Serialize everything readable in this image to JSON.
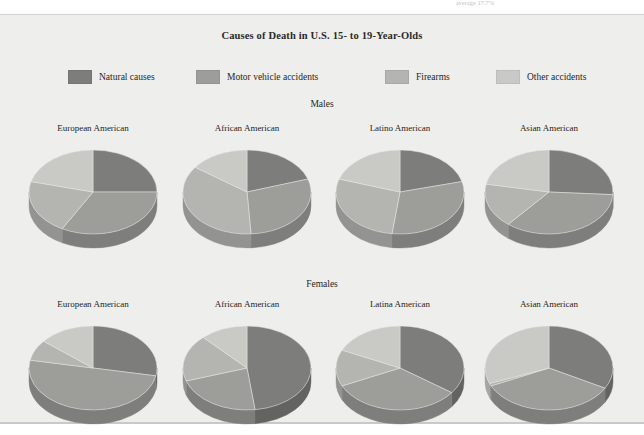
{
  "page": {
    "clipped_top_text": "average 17.7%",
    "background": "#eeeeec"
  },
  "figure": {
    "title": "Causes of Death in U.S. 15- to 19-Year-Olds",
    "sections": [
      {
        "id": "males",
        "heading": "Males"
      },
      {
        "id": "females",
        "heading": "Females"
      }
    ]
  },
  "legend": {
    "items": [
      {
        "label": "Natural causes",
        "color": "#7d7d7b",
        "key": "natural"
      },
      {
        "label": "Motor vehicle accidents",
        "color": "#9d9d9a",
        "key": "motor"
      },
      {
        "label": "Firearms",
        "color": "#b4b4b1",
        "key": "firearms"
      },
      {
        "label": "Other accidents",
        "color": "#c9c9c6",
        "key": "other"
      }
    ]
  },
  "chart_data": {
    "type": "pie",
    "title": "Causes of Death in U.S. 15- to 19-Year-Olds",
    "categories": [
      "Natural causes",
      "Motor vehicle accidents",
      "Firearms",
      "Other accidents"
    ],
    "colors": [
      "#7d7d7b",
      "#9d9d9a",
      "#b4b4b1",
      "#c9c9c6"
    ],
    "side_colors": [
      "#636361",
      "#7e7e7c",
      "#939391",
      "#a5a5a2"
    ],
    "legend_position": "top",
    "units": "percent",
    "panels": [
      {
        "group": "Males",
        "charts": [
          {
            "label": "European American",
            "values": [
              25,
              33,
              21,
              21
            ]
          },
          {
            "label": "African American",
            "values": [
              20,
              29,
              36,
              15
            ]
          },
          {
            "label": "Latino American",
            "values": [
              21,
              31,
              28,
              20
            ]
          },
          {
            "label": "Asian American",
            "values": [
              26,
              35,
              17,
              22
            ]
          }
        ]
      },
      {
        "group": "Females",
        "charts": [
          {
            "label": "European American",
            "values": [
              28,
              50,
              8,
              14
            ]
          },
          {
            "label": "African American",
            "values": [
              48,
              22,
              18,
              12
            ]
          },
          {
            "label": "Latina American",
            "values": [
              35,
              33,
              14,
              18
            ]
          },
          {
            "label": "Asian American",
            "values": [
              33,
              35,
              1,
              31
            ]
          }
        ]
      }
    ]
  }
}
